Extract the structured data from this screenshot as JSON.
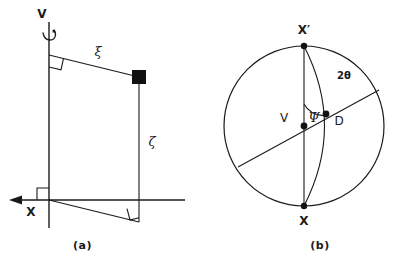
{
  "figure": {
    "type": "scientific-diagram"
  },
  "panel_a": {
    "caption": "(a)",
    "labels": {
      "axis_vertical": "V",
      "axis_horizontal": "X",
      "segment_upper": "ξ",
      "segment_vertical": "ζ"
    },
    "markers": {
      "point_marker": "filled-square",
      "right_angles": 3,
      "rotation_arrow": "curved-rotation-arrow"
    }
  },
  "panel_b": {
    "caption": "(b)",
    "labels": {
      "pole_top": "X′",
      "pole_bottom": "X",
      "center": "V",
      "point_d": "D",
      "angle_psi": "Ψ",
      "angle_two_theta": "2θ"
    },
    "markers": {
      "points": 4,
      "great_circle_arc": "arc-from-Xprime-to-X-through-D",
      "chord": "diagonal-chord-through-V"
    }
  },
  "style": {
    "ink": "#1a1a1a",
    "background": "#ffffff"
  }
}
